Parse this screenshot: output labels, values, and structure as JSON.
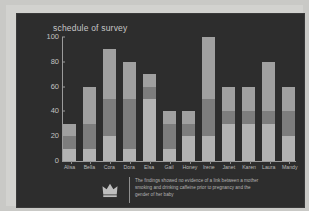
{
  "chart_data": {
    "type": "bar",
    "stacked": true,
    "title": "schedule of survey",
    "xlabel": "",
    "ylabel": "",
    "ylim": [
      0,
      100
    ],
    "yticks": [
      0,
      20,
      40,
      60,
      80,
      100
    ],
    "grid": false,
    "legend": "none",
    "categories": [
      "Alisa",
      "Bella",
      "Cora",
      "Dora",
      "Elsa",
      "Gail",
      "Honey",
      "Irene",
      "Janet",
      "Karen",
      "Laura",
      "Mandy"
    ],
    "series": [
      {
        "name": "lower",
        "color": "#b3b3b3",
        "values": [
          10,
          10,
          20,
          10,
          50,
          10,
          20,
          20,
          30,
          30,
          30,
          20
        ]
      },
      {
        "name": "middle",
        "color": "#7d7d7d",
        "values": [
          10,
          20,
          30,
          40,
          10,
          20,
          10,
          30,
          10,
          10,
          10,
          20
        ]
      },
      {
        "name": "upper",
        "color": "#a0a0a0",
        "values": [
          10,
          30,
          40,
          30,
          10,
          10,
          10,
          50,
          20,
          20,
          40,
          20
        ]
      }
    ],
    "totals": [
      30,
      60,
      90,
      80,
      70,
      40,
      40,
      100,
      60,
      60,
      80,
      60
    ]
  },
  "chart": {
    "title": "schedule of survey"
  },
  "footnote": {
    "icon": "crown-icon",
    "text": "The findings showed no evidence of a link between a mother smoking and drinking caffeine prior to pregnancy and the gender of her baby"
  },
  "colors": {
    "page_background": "#c9c9c6",
    "frame": "#d2d2cf",
    "panel": "#2d2d2d",
    "axis": "#9b9b9b",
    "text": "#c2c2c2"
  }
}
